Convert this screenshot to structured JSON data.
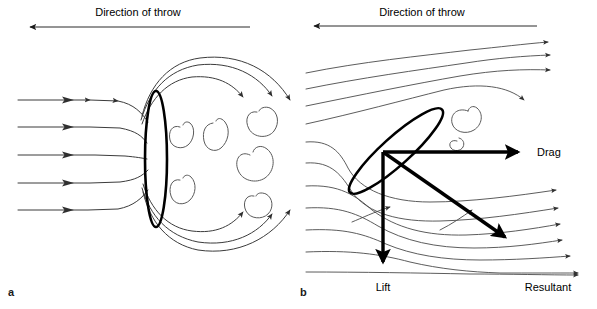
{
  "figure": {
    "background_color": "#ffffff",
    "line_color": "#000000",
    "streamline_color": "#3b3b3b",
    "width": 597,
    "height": 309
  },
  "panel_a": {
    "letter": "a",
    "throw_direction_label": "Direction of throw",
    "description": "Discus perpendicular to airflow: streamlines separate and large turbulent wake forms behind the discus",
    "discus_orientation_degrees": 0,
    "streamline_count_incoming": 5,
    "streamline_count_over_top": 3,
    "eddy_count": 6
  },
  "panel_b": {
    "letter": "b",
    "throw_direction_label": "Direction of throw",
    "description": "Discus at an angle of attack: smooth attached flow generates lift and drag, whose vector sum is the resultant",
    "discus_orientation_degrees": -42,
    "streamline_count_incoming": 8,
    "streamline_count_over_top": 4,
    "eddy_count": 2,
    "vectors": [
      {
        "name": "Drag",
        "label": "Drag",
        "direction": "horizontal-right"
      },
      {
        "name": "Lift",
        "label": "Lift",
        "direction": "vertical-down"
      },
      {
        "name": "Resultant",
        "label": "Resultant",
        "direction": "diagonal-down-right"
      }
    ],
    "drag_label": "Drag",
    "lift_label": "Lift",
    "resultant_label": "Resultant"
  }
}
